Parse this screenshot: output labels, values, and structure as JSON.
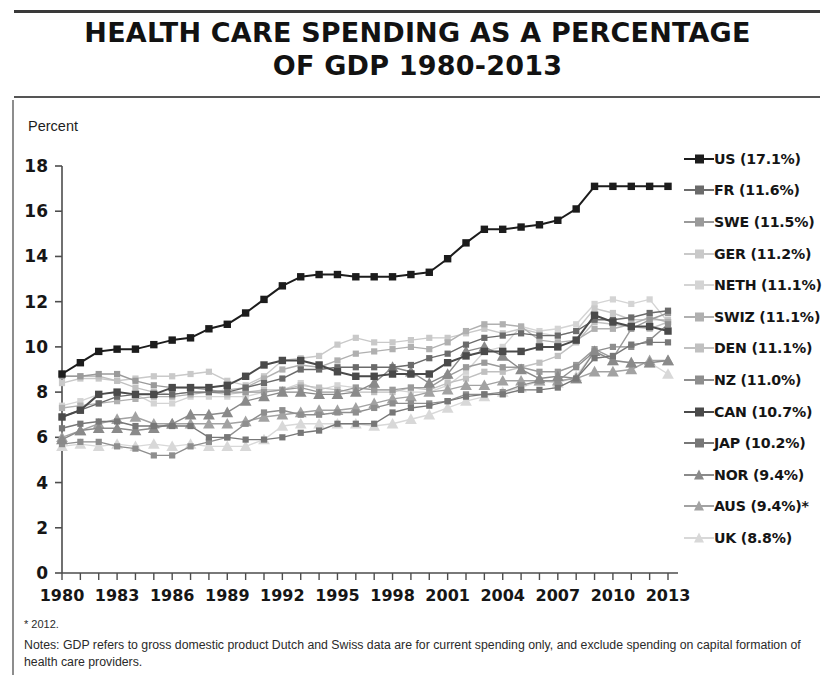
{
  "title": "HEALTH CARE SPENDING AS A PERCENTAGE OF GDP 1980-2013",
  "title_line1": "HEALTH CARE SPENDING AS A PERCENTAGE",
  "title_line2": "OF GDP 1980-2013",
  "axis": {
    "y_label": "Percent",
    "y_ticks": [
      "0",
      "2",
      "4",
      "6",
      "8",
      "10",
      "12",
      "14",
      "16",
      "18"
    ],
    "x_ticks": [
      "1980",
      "1983",
      "1986",
      "1989",
      "1992",
      "1995",
      "1998",
      "2001",
      "2004",
      "2007",
      "2010",
      "2013"
    ]
  },
  "legend": [
    {
      "label": "US (17.1%)",
      "key": "US",
      "marker": "square",
      "color": "#1c1c1c"
    },
    {
      "label": "FR (11.6%)",
      "key": "FR",
      "marker": "square",
      "color": "#6b6b6b"
    },
    {
      "label": "SWE (11.5%)",
      "key": "SWE",
      "marker": "square",
      "color": "#9a9a9a"
    },
    {
      "label": "GER (11.2%)",
      "key": "GER",
      "marker": "square",
      "color": "#c9c9c9"
    },
    {
      "label": "NETH (11.1%)",
      "key": "NETH",
      "marker": "square",
      "color": "#d4d4d4"
    },
    {
      "label": "SWIZ (11.1%)",
      "key": "SWIZ",
      "marker": "square",
      "color": "#b0b0b0"
    },
    {
      "label": "DEN (11.1%)",
      "key": "DEN",
      "marker": "square",
      "color": "#c0c0c0"
    },
    {
      "label": "NZ (11.0%)",
      "key": "NZ",
      "marker": "square",
      "color": "#8e8e8e"
    },
    {
      "label": "CAN (10.7%)",
      "key": "CAN",
      "marker": "square",
      "color": "#4a4a4a"
    },
    {
      "label": "JAP (10.2%)",
      "key": "JAP",
      "marker": "square",
      "color": "#777777"
    },
    {
      "label": "NOR (9.4%)",
      "key": "NOR",
      "marker": "triangle",
      "color": "#8a8a8a"
    },
    {
      "label": "AUS (9.4%)*",
      "key": "AUS",
      "marker": "triangle",
      "color": "#a2a2a2"
    },
    {
      "label": "UK (8.8%)",
      "key": "UK",
      "marker": "triangle",
      "color": "#d8d8d8"
    }
  ],
  "footnotes": {
    "star": "* 2012.",
    "notes": "Notes: GDP refers to gross domestic product  Dutch and Swiss data are for current spending only, and exclude spending on capital formation of health care providers."
  },
  "chart_data": {
    "type": "line",
    "title": "HEALTH CARE SPENDING AS A PERCENTAGE OF GDP 1980-2013",
    "xlabel": "",
    "ylabel": "Percent",
    "ylim": [
      0,
      18
    ],
    "xlim": [
      1980,
      2013
    ],
    "grid": false,
    "legend_position": "right",
    "x": [
      1980,
      1981,
      1982,
      1983,
      1984,
      1985,
      1986,
      1987,
      1988,
      1989,
      1990,
      1991,
      1992,
      1993,
      1994,
      1995,
      1996,
      1997,
      1998,
      1999,
      2000,
      2001,
      2002,
      2003,
      2004,
      2005,
      2006,
      2007,
      2008,
      2009,
      2010,
      2011,
      2012,
      2013
    ],
    "series": [
      {
        "name": "US",
        "marker": "square",
        "color": "#1c1c1c",
        "values": [
          8.8,
          9.3,
          9.8,
          9.9,
          9.9,
          10.1,
          10.3,
          10.4,
          10.8,
          11.0,
          11.5,
          12.1,
          12.7,
          13.1,
          13.2,
          13.2,
          13.1,
          13.1,
          13.1,
          13.2,
          13.3,
          13.9,
          14.6,
          15.2,
          15.2,
          15.3,
          15.4,
          15.6,
          16.1,
          17.1,
          17.1,
          17.1,
          17.1,
          17.1
        ]
      },
      {
        "name": "FR",
        "marker": "square",
        "color": "#6b6b6b",
        "values": [
          6.9,
          7.2,
          7.5,
          7.8,
          7.9,
          7.9,
          7.9,
          8.0,
          8.0,
          8.0,
          8.2,
          8.4,
          8.6,
          9.0,
          9.0,
          9.1,
          9.1,
          9.1,
          9.1,
          9.2,
          9.5,
          9.7,
          10.1,
          10.4,
          10.5,
          10.6,
          10.5,
          10.5,
          10.7,
          11.2,
          11.2,
          11.3,
          11.5,
          11.6
        ]
      },
      {
        "name": "SWE",
        "marker": "square",
        "color": "#9a9a9a",
        "values": [
          8.7,
          8.7,
          8.8,
          8.8,
          8.5,
          8.3,
          8.2,
          8.2,
          8.1,
          8.0,
          8.0,
          8.0,
          8.1,
          8.2,
          8.0,
          8.0,
          8.2,
          8.1,
          8.1,
          8.2,
          8.2,
          8.7,
          9.1,
          9.3,
          9.1,
          9.1,
          8.9,
          8.9,
          9.2,
          9.9,
          9.5,
          10.8,
          11.2,
          11.5
        ]
      },
      {
        "name": "GER",
        "marker": "square",
        "color": "#c9c9c9",
        "values": [
          8.4,
          8.6,
          8.6,
          8.5,
          8.6,
          8.7,
          8.7,
          8.8,
          8.9,
          8.5,
          8.3,
          8.7,
          9.4,
          9.5,
          9.6,
          10.1,
          10.4,
          10.2,
          10.2,
          10.3,
          10.4,
          10.4,
          10.6,
          10.8,
          10.6,
          10.8,
          10.6,
          10.5,
          10.7,
          11.7,
          11.5,
          11.2,
          11.2,
          11.2
        ]
      },
      {
        "name": "NETH",
        "marker": "square",
        "color": "#d4d4d4",
        "values": [
          7.4,
          7.6,
          7.9,
          8.0,
          7.9,
          7.5,
          7.5,
          7.8,
          7.8,
          7.8,
          7.8,
          8.0,
          8.1,
          8.4,
          8.1,
          8.3,
          8.2,
          8.1,
          8.1,
          8.0,
          8.0,
          8.3,
          8.9,
          9.8,
          10.0,
          10.9,
          10.7,
          10.8,
          11.0,
          11.9,
          12.1,
          11.9,
          12.1,
          11.1
        ]
      },
      {
        "name": "SWIZ",
        "marker": "square",
        "color": "#b0b0b0",
        "values": [
          7.3,
          7.4,
          7.5,
          7.6,
          7.7,
          7.8,
          7.8,
          7.9,
          8.0,
          8.1,
          8.2,
          8.6,
          9.0,
          9.2,
          9.1,
          9.4,
          9.7,
          9.8,
          9.9,
          10.0,
          9.9,
          10.2,
          10.7,
          11.0,
          11.0,
          10.9,
          10.3,
          10.2,
          10.3,
          10.8,
          10.8,
          11.0,
          11.3,
          11.1
        ]
      },
      {
        "name": "DEN",
        "marker": "square",
        "color": "#c0c0c0",
        "values": [
          8.7,
          8.7,
          8.7,
          8.5,
          8.2,
          8.0,
          7.9,
          8.0,
          8.0,
          7.9,
          8.0,
          8.1,
          8.1,
          8.3,
          8.2,
          8.1,
          8.0,
          8.0,
          8.0,
          8.2,
          8.1,
          8.4,
          8.6,
          8.9,
          8.9,
          9.1,
          9.3,
          9.6,
          10.2,
          11.1,
          11.0,
          10.9,
          10.8,
          11.1
        ]
      },
      {
        "name": "NZ",
        "marker": "square",
        "color": "#8e8e8e",
        "values": [
          5.7,
          5.8,
          5.8,
          5.6,
          5.5,
          5.2,
          5.2,
          5.6,
          5.8,
          6.0,
          6.6,
          7.1,
          7.2,
          7.0,
          7.0,
          7.1,
          7.1,
          7.3,
          7.5,
          7.5,
          7.5,
          7.6,
          7.9,
          7.9,
          8.0,
          8.3,
          8.5,
          8.5,
          9.1,
          9.8,
          10.0,
          10.0,
          10.3,
          11.0
        ]
      },
      {
        "name": "CAN",
        "marker": "square",
        "color": "#4a4a4a",
        "values": [
          6.9,
          7.2,
          7.9,
          8.0,
          7.9,
          7.9,
          8.2,
          8.2,
          8.2,
          8.3,
          8.7,
          9.2,
          9.4,
          9.4,
          9.2,
          8.9,
          8.7,
          8.7,
          8.8,
          8.8,
          8.8,
          9.3,
          9.6,
          9.8,
          9.8,
          9.8,
          10.0,
          10.0,
          10.3,
          11.4,
          11.1,
          10.9,
          10.9,
          10.7
        ]
      },
      {
        "name": "JAP",
        "marker": "square",
        "color": "#777777",
        "values": [
          6.4,
          6.6,
          6.7,
          6.7,
          6.5,
          6.5,
          6.5,
          6.5,
          6.0,
          6.0,
          5.9,
          5.9,
          6.0,
          6.2,
          6.3,
          6.6,
          6.6,
          6.6,
          7.1,
          7.3,
          7.4,
          7.6,
          7.8,
          7.9,
          7.9,
          8.1,
          8.1,
          8.2,
          8.6,
          9.5,
          9.6,
          10.1,
          10.2,
          10.2
        ]
      },
      {
        "name": "NOR",
        "marker": "triangle",
        "color": "#8a8a8a",
        "values": [
          5.9,
          6.3,
          6.4,
          6.4,
          6.3,
          6.4,
          6.6,
          7.0,
          7.0,
          7.1,
          7.6,
          7.8,
          8.0,
          8.0,
          7.9,
          7.9,
          8.0,
          8.4,
          9.1,
          8.9,
          8.4,
          8.8,
          9.8,
          10.0,
          9.6,
          9.0,
          8.6,
          8.7,
          8.6,
          9.8,
          9.4,
          9.3,
          9.3,
          9.4
        ]
      },
      {
        "name": "AUS",
        "marker": "triangle",
        "color": "#a2a2a2",
        "values": [
          6.0,
          6.3,
          6.6,
          6.8,
          6.9,
          6.6,
          6.6,
          6.6,
          6.6,
          6.6,
          6.7,
          6.9,
          7.0,
          7.1,
          7.2,
          7.2,
          7.3,
          7.5,
          7.7,
          7.8,
          8.0,
          8.1,
          8.3,
          8.3,
          8.5,
          8.5,
          8.5,
          8.5,
          8.6,
          8.9,
          8.9,
          9.0,
          9.4,
          9.4
        ]
      },
      {
        "name": "UK",
        "marker": "triangle",
        "color": "#d8d8d8",
        "values": [
          5.6,
          5.7,
          5.6,
          5.7,
          5.6,
          5.7,
          5.6,
          5.7,
          5.6,
          5.6,
          5.6,
          5.9,
          6.5,
          6.6,
          6.6,
          6.6,
          6.6,
          6.5,
          6.6,
          6.8,
          7.0,
          7.3,
          7.6,
          7.8,
          8.0,
          8.2,
          8.5,
          8.4,
          8.7,
          9.8,
          9.4,
          9.3,
          9.3,
          8.8
        ]
      }
    ]
  }
}
